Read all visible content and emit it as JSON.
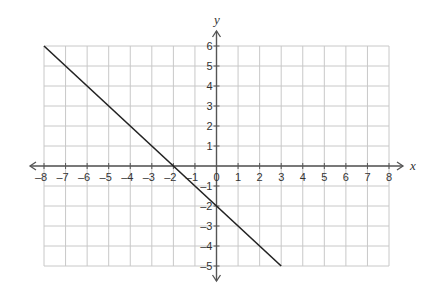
{
  "chart_data": {
    "type": "line",
    "title": "",
    "xlabel": "x",
    "ylabel": "y",
    "xlim": [
      -8,
      8
    ],
    "ylim": [
      -5,
      6
    ],
    "grid": true,
    "x_ticks": [
      -8,
      -7,
      -6,
      -5,
      -4,
      -3,
      -2,
      -1,
      0,
      1,
      2,
      3,
      4,
      5,
      6,
      7,
      8
    ],
    "y_ticks": [
      -5,
      -4,
      -3,
      -2,
      -1,
      1,
      2,
      3,
      4,
      5,
      6
    ],
    "series": [
      {
        "name": "line",
        "equation": "y = -x - 2",
        "x": [
          -8,
          3
        ],
        "y": [
          6,
          -5
        ],
        "color": "#222222"
      }
    ],
    "x_tick_labels": [
      "–8",
      "–7",
      "–6",
      "–5",
      "–4",
      "–3",
      "–2",
      "–1",
      "0",
      "1",
      "2",
      "3",
      "4",
      "5",
      "6",
      "7",
      "8"
    ],
    "y_tick_labels": [
      "6",
      "5",
      "4",
      "3",
      "2",
      "1",
      "–1",
      "–2",
      "–3",
      "–4",
      "–5"
    ]
  },
  "colors": {
    "grid": "#c8c8c8",
    "axis": "#555555",
    "line": "#222222"
  }
}
